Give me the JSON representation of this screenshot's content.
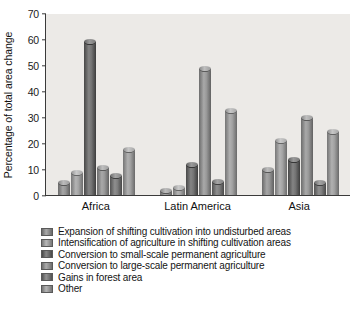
{
  "chart_data": {
    "type": "bar",
    "title": "",
    "subtitle": "",
    "xlabel": "",
    "ylabel": "Percentage of total area change",
    "ylim": [
      0,
      70
    ],
    "yticks": [
      0,
      10,
      20,
      30,
      40,
      50,
      60,
      70
    ],
    "grid": false,
    "legend_position": "below",
    "categories": [
      "Africa",
      "Latin America",
      "Asia"
    ],
    "series": [
      {
        "name": "Expansion of shifting cultivation into undisturbed areas",
        "color": "#8c8c8c",
        "values": [
          4.5,
          1.5,
          9.7
        ]
      },
      {
        "name": "Intensification of agriculture in shifting cultivation areas",
        "color": "#9a9a9a",
        "values": [
          8.5,
          2.6,
          20.6
        ]
      },
      {
        "name": "Conversion to small-scale permanent agriculture",
        "color": "#6a6a6a",
        "values": [
          59.0,
          11.5,
          13.4
        ]
      },
      {
        "name": "Conversion to large-scale permanent agriculture",
        "color": "#8f8f8f",
        "values": [
          10.2,
          48.6,
          29.8
        ]
      },
      {
        "name": "Gains in forest area",
        "color": "#757575",
        "values": [
          7.3,
          5.0,
          4.8
        ]
      },
      {
        "name": "Other",
        "color": "#979797",
        "values": [
          17.5,
          32.5,
          24.4
        ]
      }
    ]
  },
  "axis": {
    "y_title": "Percentage of total area change"
  },
  "legend": {
    "items": [
      {
        "label": "Expansion of shifting cultivation into undisturbed areas"
      },
      {
        "label": "Intensification of agriculture in shifting cultivation areas"
      },
      {
        "label": "Conversion to small-scale permanent agriculture"
      },
      {
        "label": "Conversion to large-scale permanent agriculture"
      },
      {
        "label": "Gains in forest area"
      },
      {
        "label": "Other"
      }
    ]
  }
}
